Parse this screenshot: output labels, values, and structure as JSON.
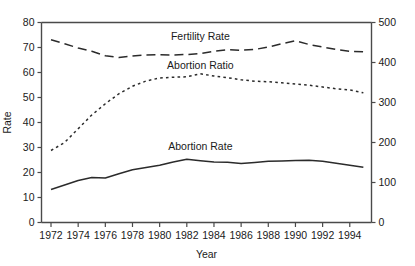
{
  "chart_data": {
    "type": "line",
    "title": "",
    "xlabel": "Year",
    "ylabel": "Rate",
    "y2label": "",
    "grid": false,
    "legend_position": "inline-annotations",
    "xlim": [
      1971.3,
      1995.6
    ],
    "ylim": [
      0,
      80
    ],
    "y2lim": [
      0,
      500
    ],
    "xticks": [
      1972,
      1974,
      1976,
      1978,
      1980,
      1982,
      1984,
      1986,
      1988,
      1990,
      1992,
      1994
    ],
    "xticklabels": [
      "1972",
      "1974",
      "1976",
      "1978",
      "1980",
      "1982",
      "1984",
      "1986",
      "1988",
      "1990",
      "1992",
      "1994"
    ],
    "yticks": [
      0,
      10,
      20,
      30,
      40,
      50,
      60,
      70,
      80
    ],
    "yticklabels": [
      "0",
      "10",
      "20",
      "30",
      "40",
      "50",
      "60",
      "70",
      "80"
    ],
    "y2ticks": [
      0,
      100,
      200,
      300,
      400,
      500
    ],
    "y2ticklabels": [
      "0",
      "100",
      "200",
      "300",
      "400",
      "500"
    ],
    "x": [
      1972,
      1973,
      1974,
      1975,
      1976,
      1977,
      1978,
      1979,
      1980,
      1981,
      1982,
      1983,
      1984,
      1985,
      1986,
      1987,
      1988,
      1989,
      1990,
      1991,
      1992,
      1993,
      1994,
      1995
    ],
    "series": [
      {
        "name": "Fertility Rate",
        "style": "dashed",
        "axis": "left",
        "label_x": 1983.0,
        "label_y": 74.5,
        "values": [
          73.1,
          71.5,
          69.8,
          68.5,
          66.7,
          66.0,
          66.6,
          67.0,
          67.1,
          67.0,
          67.2,
          67.6,
          68.5,
          69.1,
          68.9,
          69.2,
          70.2,
          71.5,
          72.7,
          71.2,
          70.2,
          69.2,
          68.5,
          68.3
        ]
      },
      {
        "name": "Abortion Ratio",
        "style": "dotted",
        "axis": "left",
        "label_x": 1983.0,
        "label_y": 63.0,
        "values": [
          28.8,
          32.0,
          37.5,
          43.0,
          47.5,
          51.5,
          54.5,
          56.6,
          57.8,
          58.1,
          58.3,
          59.5,
          58.6,
          57.9,
          57.1,
          56.5,
          56.3,
          55.9,
          55.4,
          54.9,
          54.2,
          53.5,
          53.0,
          51.9
        ]
      },
      {
        "name": "Abortion Rate",
        "style": "solid",
        "axis": "left",
        "label_x": 1983.0,
        "label_y": 30.5,
        "values": [
          13.2,
          15.0,
          16.8,
          18.0,
          17.8,
          19.5,
          21.1,
          22.0,
          22.9,
          24.2,
          25.3,
          24.7,
          24.2,
          24.1,
          23.6,
          24.0,
          24.5,
          24.6,
          24.8,
          24.9,
          24.5,
          23.7,
          22.9,
          22.1
        ]
      }
    ]
  }
}
